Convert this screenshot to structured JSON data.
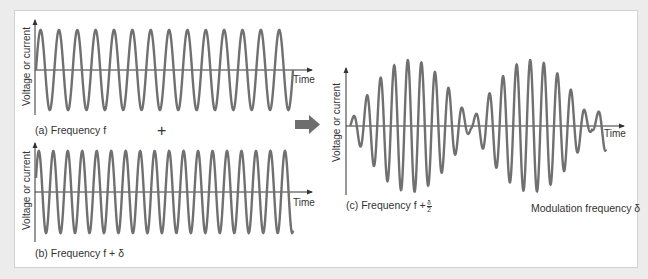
{
  "colors": {
    "background": "#ececec",
    "panel": "#ffffff",
    "panel_border": "#d2d2d2",
    "wave": "#707070",
    "axis": "#333333",
    "arrow": "#6e6e6e"
  },
  "graphs": [
    {
      "id": "a",
      "caption": "(a) Frequency f",
      "y_axis_label": "Voltage or current",
      "x_axis_label": "Time",
      "cycles": 14,
      "description": "constant-amplitude sine wave at frequency f"
    },
    {
      "id": "b",
      "caption": "(b) Frequency f + δ",
      "y_axis_label": "Voltage or current",
      "x_axis_label": "Time",
      "cycles": 18,
      "description": "constant-amplitude sine wave at frequency f + δ"
    },
    {
      "id": "c",
      "caption_prefix": "(c) Frequency f +",
      "caption_fraction": {
        "numerator": "δ",
        "denominator": "2"
      },
      "y_axis_label": "Voltage or current",
      "x_axis_label": "Time",
      "annotation": "Modulation frequency δ",
      "description": "sum of (a) and (b): beat pattern with carrier f + δ/2 and amplitude envelope at modulation frequency δ",
      "envelope_lobes": 2
    }
  ],
  "operator": "+",
  "result_arrow": "arrow-right"
}
